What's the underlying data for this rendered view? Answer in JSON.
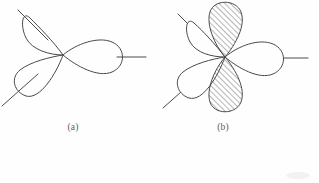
{
  "figure": {
    "kind": "orbital-lobe-diagram",
    "background_color": "#fefefe",
    "stroke_color": "#4a4a4a",
    "hatch_color": "#555555",
    "panels": [
      {
        "id": "a",
        "caption": "(a)",
        "center": {
          "x": 63,
          "y": 55
        },
        "description": "three unshaded teardrop lobes meeting at a central node",
        "lobes": [
          {
            "name": "upper-left-lobe",
            "angle_deg": 138,
            "length": 52,
            "width": 34,
            "filled": false,
            "hatched": false,
            "axis_line": {
              "from": 44,
              "to": 78
            }
          },
          {
            "name": "lower-left-lobe",
            "angle_deg": 214,
            "length": 60,
            "width": 36,
            "filled": false,
            "hatched": false,
            "axis_line": {
              "from": 48,
              "to": 86
            }
          },
          {
            "name": "right-lobe",
            "angle_deg": 0,
            "length": 63,
            "width": 34,
            "filled": false,
            "hatched": false,
            "axis_line": {
              "from": 52,
              "to": 85
            }
          }
        ]
      },
      {
        "id": "b",
        "caption": "(b)",
        "center": {
          "x": 225,
          "y": 57
        },
        "description": "three unshaded lobes plus a vertical pair of hatched lobes",
        "lobes": [
          {
            "name": "upper-left-lobe",
            "angle_deg": 140,
            "length": 48,
            "width": 32,
            "filled": false,
            "hatched": false,
            "axis_line": {
              "from": 42,
              "to": 76
            }
          },
          {
            "name": "lower-left-lobe",
            "angle_deg": 216,
            "length": 55,
            "width": 34,
            "filled": false,
            "hatched": false,
            "axis_line": {
              "from": 46,
              "to": 84
            }
          },
          {
            "name": "right-lobe",
            "angle_deg": 0,
            "length": 60,
            "width": 33,
            "filled": false,
            "hatched": false,
            "axis_line": {
              "from": 50,
              "to": 84
            }
          },
          {
            "name": "upper-hatched-lobe",
            "angle_deg": 90,
            "length": 58,
            "width": 44,
            "filled": true,
            "hatched": true,
            "axis_line": null
          },
          {
            "name": "lower-hatched-lobe",
            "angle_deg": 270,
            "length": 62,
            "width": 44,
            "filled": true,
            "hatched": true,
            "axis_line": null
          }
        ]
      }
    ]
  }
}
